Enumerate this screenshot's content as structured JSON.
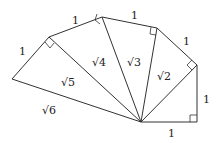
{
  "diagram": {
    "unit_labels": [
      "1",
      "1",
      "1",
      "1",
      "1",
      "1"
    ],
    "hypotenuse_labels": [
      "√2",
      "√3",
      "√4",
      "√5",
      "√6"
    ],
    "line_color": "#333333",
    "background": "#ffffff"
  }
}
